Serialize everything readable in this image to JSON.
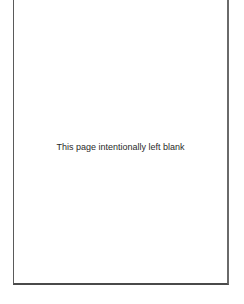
{
  "page": {
    "message": "This page intentionally left blank"
  }
}
